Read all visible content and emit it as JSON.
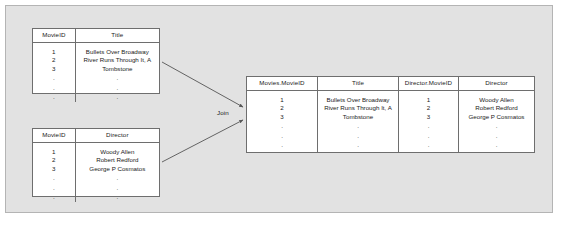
{
  "diagram": {
    "join_label": "Join",
    "colors": {
      "panel_background": "#e2e2e2",
      "panel_border": "#b4b4b4",
      "table_background": "#ffffff",
      "table_border": "#6e6e6e",
      "text": "#1a1a1a",
      "connector": "#555555"
    }
  },
  "tables": {
    "movies": {
      "name": "Movies",
      "columns": [
        "MovieID",
        "Title"
      ],
      "rows": [
        [
          "1",
          "Bullets Over Broadway"
        ],
        [
          "2",
          "River Runs Through It, A"
        ],
        [
          "3",
          "Tombstone"
        ]
      ],
      "continuation_rows": [
        [
          ".",
          "."
        ],
        [
          ".",
          "."
        ],
        [
          ".",
          "."
        ]
      ]
    },
    "directors": {
      "name": "Director",
      "columns": [
        "MovieID",
        "Director"
      ],
      "rows": [
        [
          "1",
          "Woody Allen"
        ],
        [
          "2",
          "Robert Redford"
        ],
        [
          "3",
          "George P Cosmatos"
        ]
      ],
      "continuation_rows": [
        [
          ".",
          "."
        ],
        [
          ".",
          "."
        ],
        [
          ".",
          "."
        ]
      ]
    },
    "joined": {
      "name": "Joined result",
      "columns": [
        "Movies.MovieID",
        "Title",
        "Director.MovieID",
        "Director"
      ],
      "rows": [
        [
          "1",
          "Bullets Over Broadway",
          "1",
          "Woody Allen"
        ],
        [
          "2",
          "River Runs Through It, A",
          "2",
          "Robert Redford"
        ],
        [
          "3",
          "Tombstone",
          "3",
          "George P Cosmatos"
        ]
      ],
      "continuation_rows": [
        [
          ".",
          ".",
          ".",
          "."
        ],
        [
          ".",
          ".",
          ".",
          "."
        ],
        [
          ".",
          ".",
          ".",
          "."
        ]
      ]
    }
  }
}
